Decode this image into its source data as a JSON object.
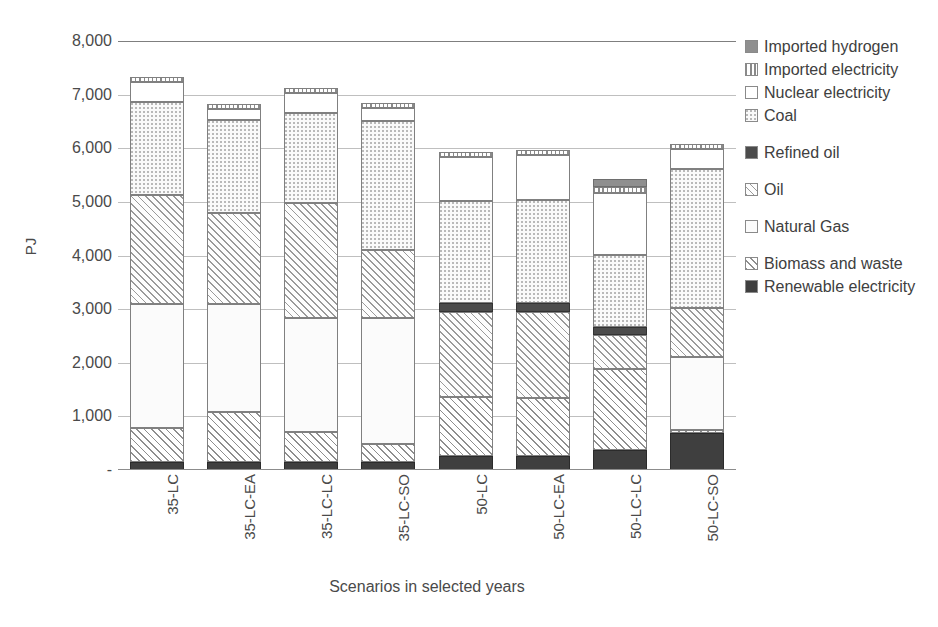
{
  "chart_data": {
    "type": "bar",
    "subtype": "stacked-bar",
    "title": "",
    "xlabel": "Scenarios in selected years",
    "ylabel": "PJ",
    "ylim": [
      0,
      8000
    ],
    "ytick_labels": [
      "8,000",
      "7,000",
      "6,000",
      "5,000",
      "4,000",
      "3,000",
      "2,000",
      "1,000",
      "-"
    ],
    "ytick_values": [
      8000,
      7000,
      6000,
      5000,
      4000,
      3000,
      2000,
      1000,
      0
    ],
    "grid": true,
    "legend_position": "right",
    "categories": [
      "35-LC",
      "35-LC-EA",
      "35-LC-LC",
      "35-LC-SO",
      "50-LC",
      "50-LC-EA",
      "50-LC-LC",
      "50-LC-SO"
    ],
    "stack_order_bottom_to_top": [
      "Renewable electricity",
      "Biomass and waste",
      "Natural Gas",
      "Oil",
      "Refined oil",
      "Coal",
      "Nuclear electricity",
      "Imported electricity",
      "Imported hydrogen"
    ],
    "series": [
      {
        "name": "Renewable electricity",
        "values": [
          150,
          150,
          150,
          150,
          260,
          260,
          370,
          690
        ]
      },
      {
        "name": "Biomass and waste",
        "values": [
          630,
          930,
          560,
          340,
          1100,
          1090,
          1520,
          50
        ]
      },
      {
        "name": "Natural Gas",
        "values": [
          2320,
          2020,
          2120,
          2340,
          0,
          0,
          0,
          1370
        ]
      },
      {
        "name": "Oil",
        "values": [
          2030,
          1700,
          2150,
          1280,
          1590,
          1600,
          620,
          920
        ]
      },
      {
        "name": "Refined oil",
        "values": [
          0,
          0,
          0,
          0,
          160,
          160,
          150,
          0
        ]
      },
      {
        "name": "Coal",
        "values": [
          1730,
          1720,
          1680,
          2400,
          1900,
          1930,
          1350,
          2590
        ]
      },
      {
        "name": "Nuclear electricity",
        "values": [
          370,
          220,
          370,
          240,
          830,
          840,
          1160,
          370
        ]
      },
      {
        "name": "Imported electricity",
        "values": [
          90,
          90,
          90,
          90,
          90,
          90,
          110,
          90
        ]
      },
      {
        "name": "Imported hydrogen",
        "values": [
          0,
          0,
          0,
          0,
          0,
          0,
          150,
          0
        ]
      }
    ],
    "totals": [
      7330,
      6830,
      7120,
      6840,
      5840,
      5830,
      5430,
      6080
    ]
  },
  "legend": {
    "items": [
      {
        "label": "Imported hydrogen",
        "pattern": "solid-grey",
        "class": "f-imphyd",
        "gap_after": false
      },
      {
        "label": "Imported electricity",
        "pattern": "vertical-stripes",
        "class": "f-impelec",
        "gap_after": false
      },
      {
        "label": "Nuclear electricity",
        "pattern": "white",
        "class": "f-nuclear",
        "gap_after": false
      },
      {
        "label": "Coal",
        "pattern": "fine-dots",
        "class": "f-coal",
        "gap_after": true
      },
      {
        "label": "Refined oil",
        "pattern": "solid-dark-grey",
        "class": "f-refined",
        "gap_after": true
      },
      {
        "label": "Oil",
        "pattern": "diagonal-hatch",
        "class": "f-oil",
        "gap_after": true
      },
      {
        "label": "Natural Gas",
        "pattern": "white",
        "class": "f-gas",
        "gap_after": true
      },
      {
        "label": "Biomass and waste",
        "pattern": "diagonal-hatch",
        "class": "f-biomass",
        "gap_after": false
      },
      {
        "label": "Renewable electricity",
        "pattern": "solid-black",
        "class": "f-renewable",
        "gap_after": false
      }
    ]
  },
  "axis": {
    "y_title": "PJ",
    "x_title": "Scenarios in selected years"
  }
}
